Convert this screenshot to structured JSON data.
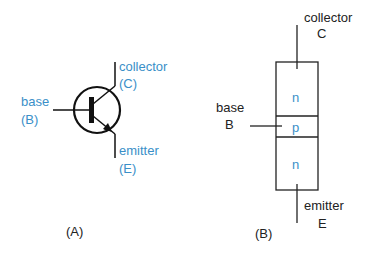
{
  "diagram": {
    "panel_a": {
      "caption": "(A)",
      "labels": {
        "collector": "collector",
        "collector_abbr": "(C)",
        "base": "base",
        "base_abbr": "(B)",
        "emitter": "emitter",
        "emitter_abbr": "(E)"
      },
      "label_color": "#3a8fc8"
    },
    "panel_b": {
      "caption": "(B)",
      "labels": {
        "collector": "collector",
        "collector_abbr": "C",
        "base": "base",
        "base_abbr": "B",
        "emitter": "emitter",
        "emitter_abbr": "E"
      },
      "regions": [
        "n",
        "p",
        "n"
      ],
      "region_color": "#3a8fc8"
    }
  }
}
